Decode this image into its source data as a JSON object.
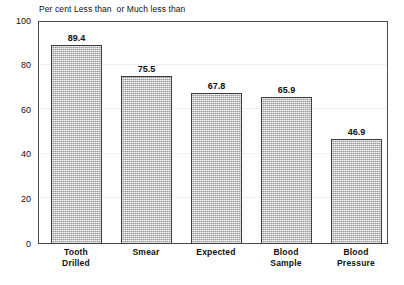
{
  "chart_data": {
    "type": "bar",
    "title": "Per cent Less than  or Much less than",
    "xlabel": "",
    "ylabel": "",
    "categories": [
      "Tooth Drilled",
      "Smear",
      "Expected",
      "Blood Sample",
      "Blood Pressure"
    ],
    "category_lines": [
      "Tooth\nDrilled",
      "Smear",
      "Expected",
      "Blood\nSample",
      "Blood\nPressure"
    ],
    "values": [
      89.4,
      75.5,
      67.8,
      65.9,
      46.9
    ],
    "value_labels": [
      "89.4",
      "75.5",
      "67.8",
      "65.9",
      "46.9"
    ],
    "ylim": [
      0,
      100
    ],
    "yticks": [
      0,
      20,
      40,
      60,
      80,
      100
    ],
    "ytick_labels": [
      "0",
      "20",
      "40",
      "60",
      "80",
      "100"
    ],
    "grid": true,
    "legend": false,
    "bar_fill_color": "#c2c2c2",
    "bar_border_color": "#3d3d3d",
    "axis_color": "#4a4a4a",
    "background_color": "#ffffff",
    "text_color": "#111111"
  }
}
